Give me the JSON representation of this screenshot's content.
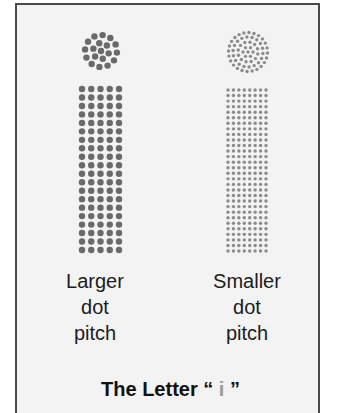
{
  "figure": {
    "title_prefix": "The Letter",
    "title_open_quote": "“",
    "title_letter": "i",
    "title_close_quote": "”",
    "colors": {
      "frame_border": "#4a4a4a",
      "frame_background": "#f3f3f3",
      "large_dot": "#6a6a6a",
      "small_dot": "#8c8c8c",
      "title_letter": "#9a9a9a"
    },
    "panels": [
      {
        "id": "larger",
        "label_lines": [
          "Larger",
          "dot",
          "pitch"
        ],
        "grid_columns": 5,
        "grid_rows": 20,
        "dot_radius": 3.2
      },
      {
        "id": "smaller",
        "label_lines": [
          "Smaller",
          "dot",
          "pitch"
        ],
        "grid_columns": 8,
        "grid_rows": 30,
        "dot_radius": 1.7
      }
    ]
  }
}
